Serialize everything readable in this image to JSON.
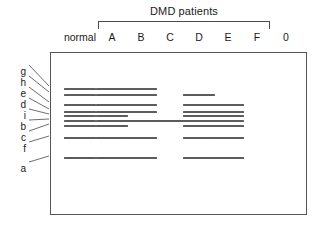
{
  "figure": {
    "type": "gel-electrophoresis-diagram",
    "group_caption": "DMD patients",
    "box": {
      "x": 50,
      "y": 52,
      "width": 257,
      "height": 163
    },
    "bracket": {
      "x": 98,
      "y": 21,
      "width": 172
    }
  },
  "lanes": [
    {
      "id": "normal",
      "label": "normal",
      "center_x": 80,
      "in_group": false
    },
    {
      "id": "A",
      "label": "A",
      "center_x": 112,
      "in_group": true
    },
    {
      "id": "B",
      "label": "B",
      "center_x": 141,
      "in_group": true
    },
    {
      "id": "C",
      "label": "C",
      "center_x": 170,
      "in_group": true
    },
    {
      "id": "D",
      "label": "D",
      "center_x": 199,
      "in_group": true
    },
    {
      "id": "E",
      "label": "E",
      "center_x": 228,
      "in_group": true
    },
    {
      "id": "F",
      "label": "F",
      "center_x": 257,
      "in_group": true
    },
    {
      "id": "0",
      "label": "0",
      "center_x": 286,
      "in_group": false
    }
  ],
  "rows": [
    {
      "id": "g",
      "label": "g",
      "y": 88,
      "label_y": 66
    },
    {
      "id": "h",
      "label": "h",
      "y": 94,
      "label_y": 77
    },
    {
      "id": "e",
      "label": "e",
      "y": 104,
      "label_y": 88
    },
    {
      "id": "d",
      "label": "d",
      "y": 111,
      "label_y": 99
    },
    {
      "id": "i",
      "label": "i",
      "y": 115,
      "label_y": 110
    },
    {
      "id": "b",
      "label": "b",
      "y": 120,
      "label_y": 121
    },
    {
      "id": "c",
      "label": "c",
      "y": 125,
      "label_y": 132
    },
    {
      "id": "f",
      "label": "f",
      "y": 137,
      "label_y": 143
    },
    {
      "id": "a",
      "label": "a",
      "y": 157,
      "label_y": 163
    }
  ],
  "bands": [
    {
      "lane": "normal",
      "row": "g"
    },
    {
      "lane": "normal",
      "row": "h"
    },
    {
      "lane": "normal",
      "row": "e"
    },
    {
      "lane": "normal",
      "row": "d"
    },
    {
      "lane": "normal",
      "row": "i"
    },
    {
      "lane": "normal",
      "row": "b"
    },
    {
      "lane": "normal",
      "row": "c"
    },
    {
      "lane": "normal",
      "row": "f"
    },
    {
      "lane": "normal",
      "row": "a"
    },
    {
      "lane": "A",
      "row": "g"
    },
    {
      "lane": "A",
      "row": "h"
    },
    {
      "lane": "A",
      "row": "e"
    },
    {
      "lane": "A",
      "row": "d"
    },
    {
      "lane": "A",
      "row": "i"
    },
    {
      "lane": "A",
      "row": "b"
    },
    {
      "lane": "A",
      "row": "c"
    },
    {
      "lane": "A",
      "row": "f"
    },
    {
      "lane": "A",
      "row": "a"
    },
    {
      "lane": "B",
      "row": "g"
    },
    {
      "lane": "B",
      "row": "h"
    },
    {
      "lane": "B",
      "row": "e"
    },
    {
      "lane": "B",
      "row": "d"
    },
    {
      "lane": "B",
      "row": "b"
    },
    {
      "lane": "B",
      "row": "f"
    },
    {
      "lane": "B",
      "row": "a"
    },
    {
      "lane": "C",
      "row": "b"
    },
    {
      "lane": "D",
      "row": "h"
    },
    {
      "lane": "D",
      "row": "e"
    },
    {
      "lane": "D",
      "row": "d"
    },
    {
      "lane": "D",
      "row": "i"
    },
    {
      "lane": "D",
      "row": "b"
    },
    {
      "lane": "D",
      "row": "c"
    },
    {
      "lane": "D",
      "row": "f"
    },
    {
      "lane": "D",
      "row": "a"
    },
    {
      "lane": "E",
      "row": "e"
    },
    {
      "lane": "E",
      "row": "d"
    },
    {
      "lane": "E",
      "row": "i"
    },
    {
      "lane": "E",
      "row": "b"
    },
    {
      "lane": "E",
      "row": "c"
    },
    {
      "lane": "E",
      "row": "f"
    },
    {
      "lane": "E",
      "row": "a"
    }
  ],
  "leader_lines": [
    {
      "row": "g",
      "x1": 29,
      "y1": 65,
      "x2": 49,
      "y2": 86
    },
    {
      "row": "h",
      "x1": 29,
      "y1": 76,
      "x2": 49,
      "y2": 92
    },
    {
      "row": "e",
      "x1": 29,
      "y1": 87,
      "x2": 49,
      "y2": 102
    },
    {
      "row": "d",
      "x1": 29,
      "y1": 98,
      "x2": 49,
      "y2": 109
    },
    {
      "row": "i",
      "x1": 29,
      "y1": 109,
      "x2": 49,
      "y2": 114
    },
    {
      "row": "b",
      "x1": 29,
      "y1": 120,
      "x2": 49,
      "y2": 119
    },
    {
      "row": "c",
      "x1": 29,
      "y1": 131,
      "x2": 49,
      "y2": 124
    },
    {
      "row": "f",
      "x1": 29,
      "y1": 142,
      "x2": 49,
      "y2": 136
    },
    {
      "row": "a",
      "x1": 29,
      "y1": 162,
      "x2": 49,
      "y2": 156
    }
  ],
  "style": {
    "band_color": "#5d5d5d",
    "band_width": 32,
    "band_height": 2,
    "box_border_color": "#555555",
    "text_color": "#1a1a1a",
    "background": "#ffffff"
  }
}
